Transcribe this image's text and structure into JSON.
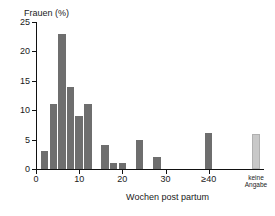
{
  "chart_data": {
    "type": "bar",
    "title": "",
    "ylabel": "Frauen (%)",
    "xlabel": "Wochen post partum",
    "ylim": [
      0,
      25
    ],
    "xlim": [
      0,
      44
    ],
    "yticks": [
      0,
      5,
      10,
      15,
      20,
      25
    ],
    "ytick_labels": [
      "0",
      "5",
      "10",
      "15",
      "20",
      "25"
    ],
    "xticks": [
      0,
      10,
      20,
      30,
      40
    ],
    "xtick_labels": [
      "0",
      "10",
      "20",
      "30",
      "≥40"
    ],
    "grid": false,
    "legend": null,
    "categories": [
      2,
      4,
      6,
      8,
      10,
      12,
      16,
      18,
      20,
      24,
      28,
      40
    ],
    "values": [
      3,
      11,
      23,
      14,
      9,
      11,
      4,
      1,
      1,
      5,
      2,
      6.2
    ],
    "bars": [
      {
        "x": 2,
        "value": 3,
        "color": "#6e6e6e"
      },
      {
        "x": 4,
        "value": 11,
        "color": "#6e6e6e"
      },
      {
        "x": 6,
        "value": 23,
        "color": "#6e6e6e"
      },
      {
        "x": 8,
        "value": 14,
        "color": "#6e6e6e"
      },
      {
        "x": 10,
        "value": 9,
        "color": "#6e6e6e"
      },
      {
        "x": 12,
        "value": 11,
        "color": "#6e6e6e"
      },
      {
        "x": 16,
        "value": 4,
        "color": "#6e6e6e"
      },
      {
        "x": 18,
        "value": 1,
        "color": "#6e6e6e"
      },
      {
        "x": 20,
        "value": 1,
        "color": "#6e6e6e"
      },
      {
        "x": 24,
        "value": 5,
        "color": "#6e6e6e"
      },
      {
        "x": 28,
        "value": 2,
        "color": "#6e6e6e"
      },
      {
        "x": 40,
        "value": 6.2,
        "color": "#6e6e6e"
      }
    ],
    "extra_category": {
      "label_line1": "keine",
      "label_line2": "Angabe",
      "value": 6,
      "color": "#c8c8c8"
    },
    "colors": {
      "bar_primary": "#6e6e6e",
      "bar_missing": "#c8c8c8",
      "axis": "#111111",
      "text": "#1a1a1a",
      "background": "#ffffff"
    }
  }
}
